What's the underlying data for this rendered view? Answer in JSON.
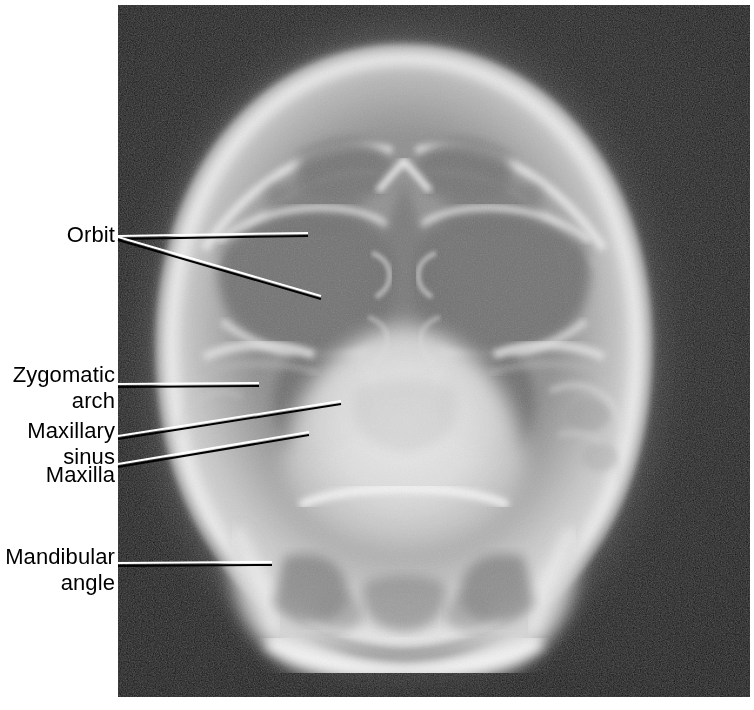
{
  "figure": {
    "kind": "radiograph-figure",
    "modality": "x-ray",
    "view": "occipitomental / PA skull projection",
    "background_color": "#ffffff",
    "plate": {
      "x": 118,
      "y": 5,
      "width": 632,
      "height": 692,
      "background_color": "#121212",
      "bone_color": "#e8e8e8",
      "soft_tissue_color": "#8a8a8a"
    }
  },
  "annotations": [
    {
      "id": "orbit",
      "label": "Orbit",
      "lines": [
        "Orbit"
      ],
      "text_right": 115,
      "text_top": 222,
      "leaders": [
        {
          "x1": 118,
          "y1": 236,
          "x2": 308,
          "y2": 233
        },
        {
          "x1": 118,
          "y1": 237,
          "x2": 321,
          "y2": 296
        }
      ]
    },
    {
      "id": "zygomatic-arch",
      "label": "Zygomatic arch",
      "lines": [
        "Zygomatic",
        "arch"
      ],
      "text_right": 115,
      "text_top": 362,
      "leaders": [
        {
          "x1": 118,
          "y1": 384,
          "x2": 259,
          "y2": 383
        }
      ]
    },
    {
      "id": "maxillary-sinus",
      "label": "Maxillary sinus",
      "lines": [
        "Maxillary",
        "sinus"
      ],
      "text_right": 115,
      "text_top": 418,
      "leaders": [
        {
          "x1": 118,
          "y1": 436,
          "x2": 341,
          "y2": 401
        }
      ]
    },
    {
      "id": "maxilla",
      "label": "Maxilla",
      "lines": [
        "Maxilla"
      ],
      "text_right": 115,
      "text_top": 462,
      "leaders": [
        {
          "x1": 118,
          "y1": 464,
          "x2": 309,
          "y2": 432
        }
      ]
    },
    {
      "id": "mandibular-angle",
      "label": "Mandibular angle",
      "lines": [
        "Mandibular",
        "angle"
      ],
      "text_right": 115,
      "text_top": 544,
      "leaders": [
        {
          "x1": 118,
          "y1": 563,
          "x2": 272,
          "y2": 562
        }
      ]
    }
  ],
  "leader_style": {
    "stroke": "#ffffff",
    "shadow_stroke": "#000000",
    "width": 2
  }
}
